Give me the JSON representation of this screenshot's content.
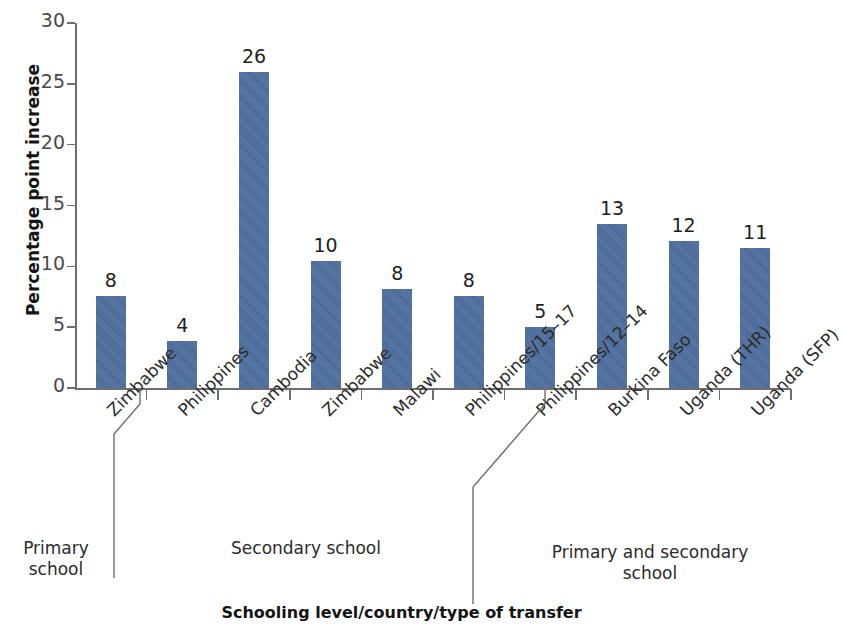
{
  "chart_data": {
    "type": "bar",
    "title": "",
    "xlabel": "Schooling level/country/type of transfer",
    "ylabel": "Percentage point increase",
    "ylim": [
      0,
      30
    ],
    "yticks": [
      0,
      5,
      10,
      15,
      20,
      25,
      30
    ],
    "grid": false,
    "legend": null,
    "bar_color": "#4f6f9f",
    "categories": [
      "Zimbabwe",
      "Philippines",
      "Cambodia",
      "Zimbabwe",
      "Malawi",
      "Philippines/15–17",
      "Philippines/12–14",
      "Burkina Faso",
      "Uganda (THR)",
      "Uganda (SFP)"
    ],
    "values": [
      7.6,
      3.9,
      26.0,
      10.4,
      8.1,
      7.6,
      5.0,
      13.5,
      12.1,
      11.5
    ],
    "data_labels": [
      "8",
      "4",
      "26",
      "10",
      "8",
      "8",
      "5",
      "13",
      "12",
      "11"
    ],
    "groups": [
      {
        "label": "Primary\nschool",
        "label_lines": [
          "Primary",
          "school"
        ],
        "members": [
          "Zimbabwe"
        ]
      },
      {
        "label": "Secondary school",
        "label_lines": [
          "Secondary school"
        ],
        "members": [
          "Philippines",
          "Cambodia",
          "Zimbabwe",
          "Malawi",
          "Philippines/15–17",
          "Philippines/12–14"
        ]
      },
      {
        "label": "Primary and secondary\nschool",
        "label_lines": [
          "Primary and secondary",
          "school"
        ],
        "members": [
          "Burkina Faso",
          "Uganda (THR)",
          "Uganda (SFP)"
        ]
      }
    ]
  },
  "axes": {
    "y_title": "Percentage point increase",
    "x_title": "Schooling level/country/type of transfer",
    "y_ticks": [
      "0",
      "5",
      "10",
      "15",
      "20",
      "25",
      "30"
    ]
  },
  "group_labels": {
    "primary_line1": "Primary",
    "primary_line2": "school",
    "secondary_line1": "Secondary school",
    "both_line1": "Primary and secondary",
    "both_line2": "school"
  }
}
